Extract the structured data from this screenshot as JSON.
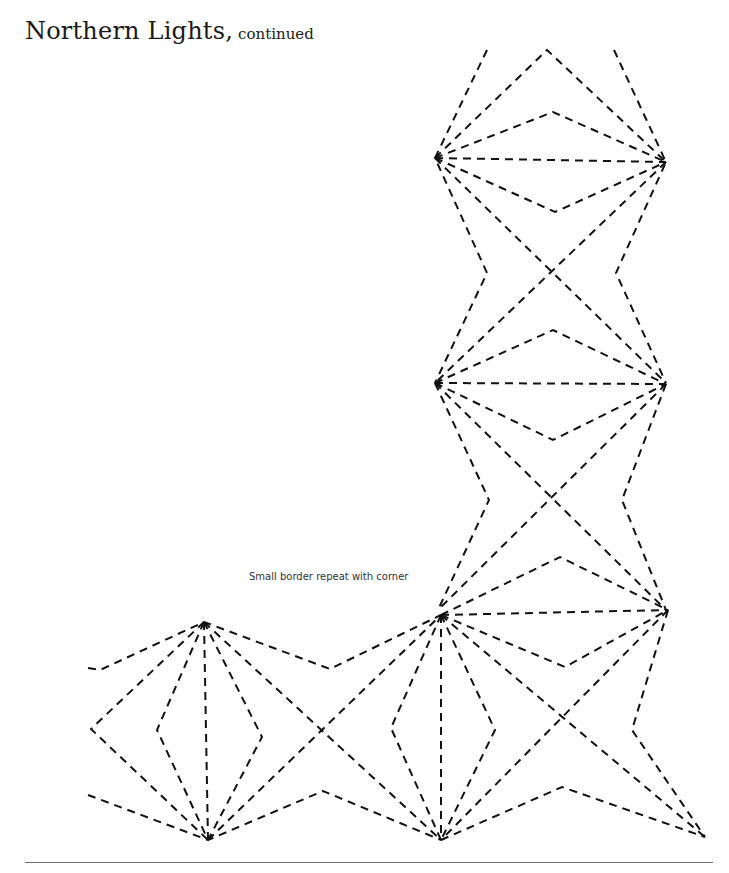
{
  "header": {
    "title": "Northern Lights,",
    "subtitle": "continued"
  },
  "figure": {
    "caption": "Small border repeat with corner",
    "line_style": "dashed",
    "stroke_color": "#111111"
  },
  "footer": {
    "text": ""
  }
}
